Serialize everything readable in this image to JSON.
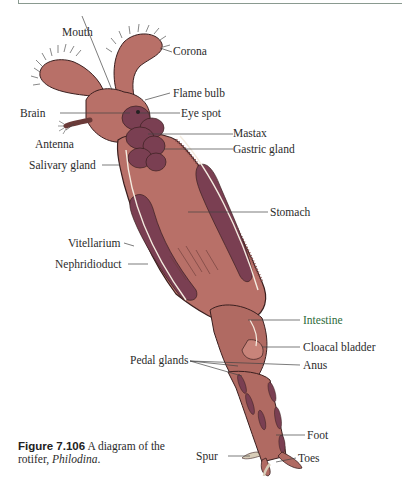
{
  "figure": {
    "number": "Figure 7.106",
    "caption_text": "A diagram of the rotifer, ",
    "caption_italic": "Philodina",
    "caption_end": "."
  },
  "labels": {
    "mouth": "Mouth",
    "corona": "Corona",
    "flame_bulb": "Flame bulb",
    "brain": "Brain",
    "eye_spot": "Eye spot",
    "antenna": "Antenna",
    "mastax": "Mastax",
    "gastric_gland": "Gastric gland",
    "salivary_gland": "Salivary gland",
    "stomach": "Stomach",
    "vitellarium": "Vitellarium",
    "nephridioduct": "Nephridioduct",
    "intestine": "Intestine",
    "cloacal_bladder": "Cloacal bladder",
    "pedal_glands": "Pedal glands",
    "anus": "Anus",
    "foot": "Foot",
    "spur": "Spur",
    "toes": "Toes"
  },
  "colors": {
    "body": "#b87068",
    "body_dark": "#8a4a48",
    "organ": "#7a3f52",
    "outline": "#3a1f1f",
    "leader": "#444444",
    "intestine_label": "#2e6b3a"
  }
}
